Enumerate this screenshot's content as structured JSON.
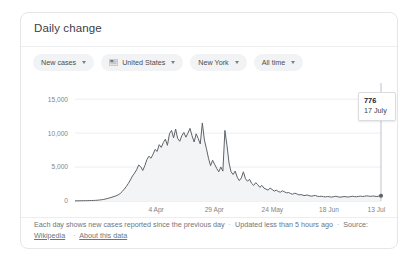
{
  "card": {
    "title": "Daily change"
  },
  "filters": [
    {
      "label": "New cases",
      "icon": null
    },
    {
      "label": "United States",
      "icon": "us-flag-icon"
    },
    {
      "label": "New York",
      "icon": null
    },
    {
      "label": "All time",
      "icon": null
    }
  ],
  "tooltip": {
    "value": "776",
    "date": "17 July"
  },
  "footer": {
    "description": "Each day shows new cases reported since the previous day",
    "updated": "Updated less than 5 hours ago",
    "source_label": "Source:",
    "source_name": "Wikipedia",
    "about_link": "About this data",
    "separator": "·"
  },
  "chart_data": {
    "type": "area",
    "title": "Daily change",
    "xlabel": "",
    "ylabel": "",
    "ylim": [
      0,
      16500
    ],
    "yticks": [
      0,
      5000,
      10000,
      15000
    ],
    "ytick_labels": [
      "0",
      "5,000",
      "10,000",
      "15,000"
    ],
    "xtick_labels": [
      "4 Apr",
      "29 Apr",
      "24 May",
      "18 Jun",
      "13 Jul"
    ],
    "xtick_positions": [
      0.265,
      0.455,
      0.645,
      0.83,
      0.985
    ],
    "grid": true,
    "legend": null,
    "annotation": {
      "value": 776,
      "date": "17 July"
    },
    "series": [
      {
        "name": "New cases",
        "color": "#5f6368",
        "values": [
          20,
          25,
          30,
          35,
          40,
          45,
          55,
          60,
          70,
          80,
          95,
          120,
          150,
          190,
          240,
          300,
          380,
          470,
          560,
          660,
          760,
          900,
          1100,
          1400,
          1750,
          2150,
          2600,
          3100,
          3700,
          4100,
          4600,
          5300,
          5050,
          4500,
          5200,
          6100,
          6600,
          6300,
          6900,
          7600,
          7300,
          8300,
          7900,
          8600,
          9100,
          8200,
          9900,
          10400,
          9300,
          10600,
          9200,
          8800,
          9600,
          10100,
          9400,
          10000,
          10700,
          9600,
          8700,
          9900,
          9200,
          8400,
          11500,
          9000,
          7700,
          6300,
          5200,
          6000,
          5400,
          4800,
          4300,
          5000,
          4400,
          10400,
          8200,
          5600,
          4300,
          3900,
          4400,
          3500,
          3000,
          3400,
          4300,
          3300,
          2900,
          3200,
          2600,
          2300,
          2700,
          2400,
          2000,
          2300,
          1900,
          1750,
          1600,
          1900,
          1700,
          1450,
          1600,
          1400,
          1300,
          1500,
          1350,
          1200,
          1250,
          1100,
          1000,
          1150,
          1050,
          900,
          950,
          850,
          800,
          900,
          780,
          720,
          760,
          820,
          700,
          660,
          700,
          640,
          600,
          660,
          620,
          580,
          640,
          700,
          620,
          560,
          600,
          660,
          620,
          580,
          640,
          700,
          660,
          620,
          680,
          720,
          660,
          700,
          760,
          720,
          680,
          740,
          700,
          660,
          720,
          776
        ]
      }
    ]
  }
}
